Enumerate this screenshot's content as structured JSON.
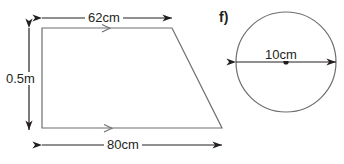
{
  "figure_e": {
    "part_label": ")",
    "shape": "trapezoid",
    "top_dimension": "62cm",
    "bottom_dimension": "80cm",
    "height_dimension": "0.5m",
    "icons": {
      "top_arrow": "double-headed-arrow-icon",
      "bottom_arrow": "double-headed-arrow-icon",
      "height_arrow": "double-headed-vertical-arrow-icon",
      "parallel_marker": "chevron-parallel-marker-icon"
    }
  },
  "figure_f": {
    "part_label": "f)",
    "shape": "circle",
    "diameter_dimension": "10cm",
    "icons": {
      "diameter_arrow": "double-headed-arrow-icon",
      "center_point": "center-dot-icon"
    }
  },
  "style": {
    "stroke": "#6d6e71",
    "text": "#231f20",
    "arrow": "#231f20",
    "background": "#ffffff"
  }
}
